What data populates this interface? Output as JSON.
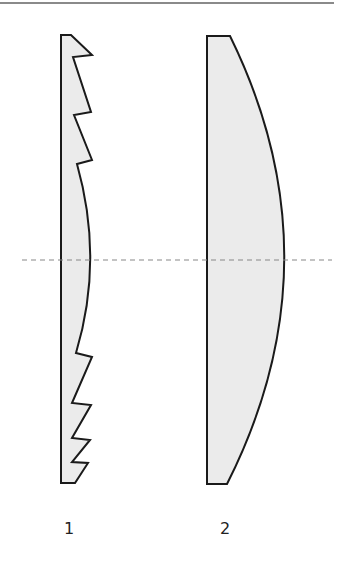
{
  "diagram": {
    "colors": {
      "lens_fill": "#ebebeb",
      "lens_stroke": "#1a1a1a",
      "optical_axis": "#888888",
      "top_rule": "#8a8a8a"
    },
    "lenses": [
      {
        "id": "fresnel",
        "label": "1",
        "type": "fresnel-lens",
        "path": "M61,35 L71,35 L92,55 L73,57 L91,112 L74,115 L92,160 L77,164 Q104,260 76,353 L92,357 L72,403 L91,405 L72,438 L90,440 L72,462 L88,463 L75,483 L61,483 Z"
      },
      {
        "id": "plano-convex",
        "label": "2",
        "type": "plano-convex-lens",
        "path": "M207,36 L230,36 Q340,260 227,484 L207,484 Z"
      }
    ],
    "optical_axis": {
      "x1": 22,
      "x2": 332,
      "y": 260,
      "dash": "5,4"
    },
    "labels": [
      {
        "text": "1",
        "x": 69,
        "y": 521
      },
      {
        "text": "2",
        "x": 225,
        "y": 521
      }
    ]
  }
}
